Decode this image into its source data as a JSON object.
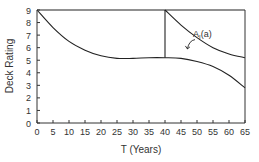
{
  "chart_data": {
    "type": "line",
    "title": "",
    "xlabel": "T (Years)",
    "ylabel": "Deck Rating",
    "xlim": [
      0,
      65
    ],
    "ylim": [
      0,
      9
    ],
    "xticks": [
      0,
      5,
      10,
      15,
      20,
      25,
      30,
      35,
      40,
      45,
      50,
      55,
      60,
      65
    ],
    "yticks": [
      0,
      1,
      2,
      3,
      4,
      5,
      6,
      7,
      8,
      9
    ],
    "grid": false,
    "annotations": [
      {
        "text": "A",
        "subscript": "I",
        "suffix": "(a)",
        "x": 50,
        "y": 7.2,
        "arrow_to": [
          47,
          5.9
        ]
      }
    ],
    "series": [
      {
        "name": "Deterioration without intervention",
        "points": [
          [
            0,
            9
          ],
          [
            5,
            7.6
          ],
          [
            10,
            6.5
          ],
          [
            15,
            5.8
          ],
          [
            20,
            5.35
          ],
          [
            25,
            5.15
          ],
          [
            30,
            5.15
          ],
          [
            35,
            5.2
          ],
          [
            40,
            5.2
          ],
          [
            45,
            5.15
          ],
          [
            50,
            4.9
          ],
          [
            55,
            4.5
          ],
          [
            60,
            3.8
          ],
          [
            65,
            2.8
          ]
        ]
      },
      {
        "name": "Deterioration after intervention at T=40",
        "points": [
          [
            40,
            9
          ],
          [
            45,
            7.8
          ],
          [
            50,
            6.8
          ],
          [
            55,
            6.0
          ],
          [
            60,
            5.5
          ],
          [
            65,
            5.2
          ]
        ]
      },
      {
        "name": "Intervention jump at T=40",
        "points": [
          [
            40,
            5.2
          ],
          [
            40,
            9
          ]
        ]
      },
      {
        "name": "Maximum rating line",
        "points": [
          [
            0,
            9
          ],
          [
            65,
            9
          ]
        ]
      }
    ]
  }
}
